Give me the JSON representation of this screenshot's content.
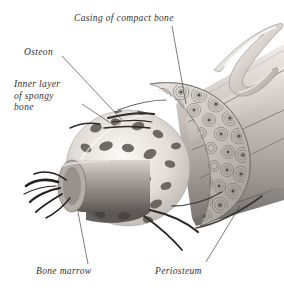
{
  "figure": {
    "style": "grayscale pencil and wash anatomical drawing",
    "background_color": "#ffffff",
    "label_color": "#33302f",
    "leader_line_color": "#4a4745",
    "width": 284,
    "height": 298
  },
  "labels": {
    "casing": "Casing of compact bone",
    "osteon": "Osteon",
    "inner_layer_line1": "Inner layer",
    "inner_layer_line2": "of spongy",
    "inner_layer_line3": "bone",
    "bone_marrow": "Bone marrow",
    "periosteum": "Periosteum"
  },
  "structures": [
    {
      "name": "compact-bone-casing",
      "label": "Casing of compact bone",
      "description": "Dense outer cortical shell ringing the cut end"
    },
    {
      "name": "osteon",
      "label": "Osteon",
      "description": "Concentric lamellar rings with central Haversian canal"
    },
    {
      "name": "spongy-bone",
      "label": "Inner layer of spongy bone",
      "description": "Trabecular lattice with irregular dark cavities"
    },
    {
      "name": "bone-marrow",
      "label": "Bone marrow",
      "description": "Cylindrical marrow core exposed at the sectioned end"
    },
    {
      "name": "periosteum",
      "label": "Periosteum",
      "description": "Fibrous membrane peeled back along the shaft"
    }
  ],
  "palette": {
    "bone_light": "#f2efec",
    "bone_mid": "#c9c4bf",
    "bone_shadow": "#8e8884",
    "cavity_dark": "#5f5a57",
    "marrow_gray": "#a39d98",
    "vessel_dark": "#2b2826",
    "membrane_highlight": "#ffffff"
  }
}
